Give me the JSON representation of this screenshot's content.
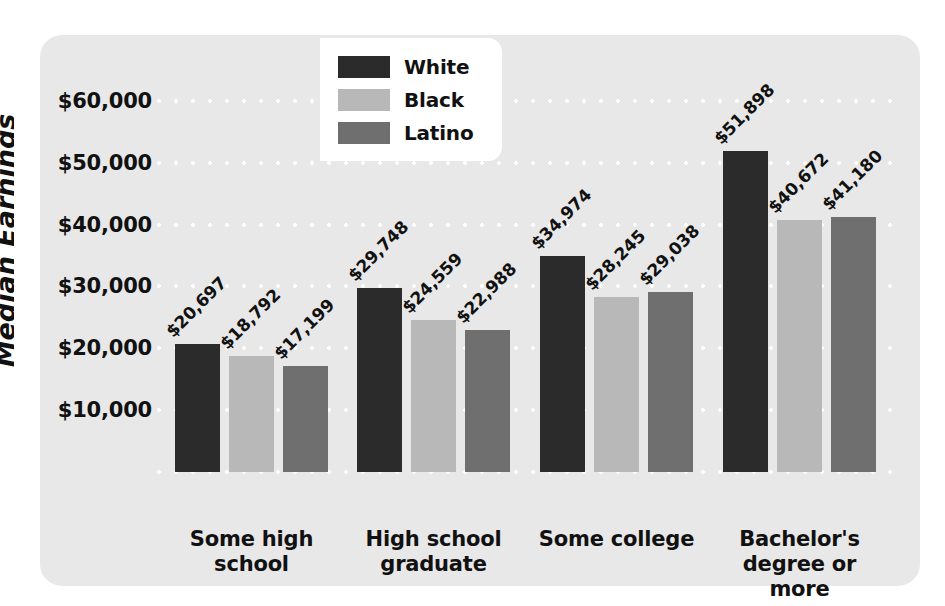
{
  "edge": {
    "clipped_text": "Median Earnings"
  },
  "legend": {
    "position": "top-left-inside",
    "entries": [
      {
        "label": "White",
        "color": "#2b2b2b"
      },
      {
        "label": "Black",
        "color": "#b8b8b8"
      },
      {
        "label": "Latino",
        "color": "#6f6f6f"
      }
    ]
  },
  "chart_data": {
    "type": "bar",
    "title": "",
    "subtitle": "",
    "xlabel": "",
    "ylabel": "",
    "grid": true,
    "legend_position": "top-left",
    "ylim": [
      0,
      65000
    ],
    "y_ticks": [
      10000,
      20000,
      30000,
      40000,
      50000,
      60000
    ],
    "y_tick_labels": [
      "$10,000",
      "$20,000",
      "$30,000",
      "$40,000",
      "$50,000",
      "$60,000"
    ],
    "categories": [
      "Some high\nschool",
      "High school\ngraduate",
      "Some college",
      "Bachelor's\ndegree or\nmore"
    ],
    "category_lines": [
      [
        "Some high",
        "school"
      ],
      [
        "High school",
        "graduate"
      ],
      [
        "Some college"
      ],
      [
        "Bachelor's",
        "degree or",
        "more"
      ]
    ],
    "series": [
      {
        "name": "White",
        "color": "#2b2b2b",
        "values": [
          20697,
          29748,
          34974,
          51898
        ],
        "labels": [
          "$20,697",
          "$29,748",
          "$34,974",
          "$51,898"
        ]
      },
      {
        "name": "Black",
        "color": "#b8b8b8",
        "values": [
          18792,
          24559,
          28245,
          40672
        ],
        "labels": [
          "$18,792",
          "$24,559",
          "$28,245",
          "$40,672"
        ]
      },
      {
        "name": "Latino",
        "color": "#6f6f6f",
        "values": [
          17199,
          22988,
          29038,
          41180
        ],
        "labels": [
          "$17,199",
          "$22,988",
          "$29,038",
          "$41,180"
        ]
      }
    ]
  }
}
